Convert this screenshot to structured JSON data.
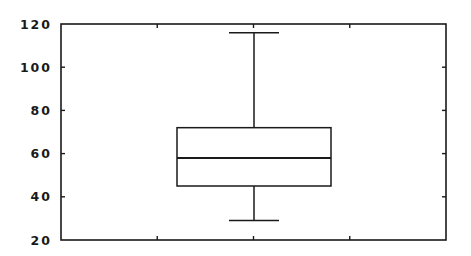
{
  "chart_data": {
    "type": "box",
    "title": "",
    "xlabel": "",
    "ylabel": "",
    "ylim": [
      20,
      120
    ],
    "yticks": [
      20,
      40,
      60,
      80,
      100,
      120
    ],
    "ytick_labels": [
      "20",
      "40",
      "60",
      "80",
      "100",
      "120"
    ],
    "xticks_count": 3,
    "grid": false,
    "legend": null,
    "series": [
      {
        "name": "",
        "whisker_low": 29,
        "q1": 45,
        "median": 58,
        "q3": 72,
        "whisker_high": 116
      }
    ]
  },
  "colors": {
    "line": "#1a1a1a",
    "background": "#ffffff"
  }
}
